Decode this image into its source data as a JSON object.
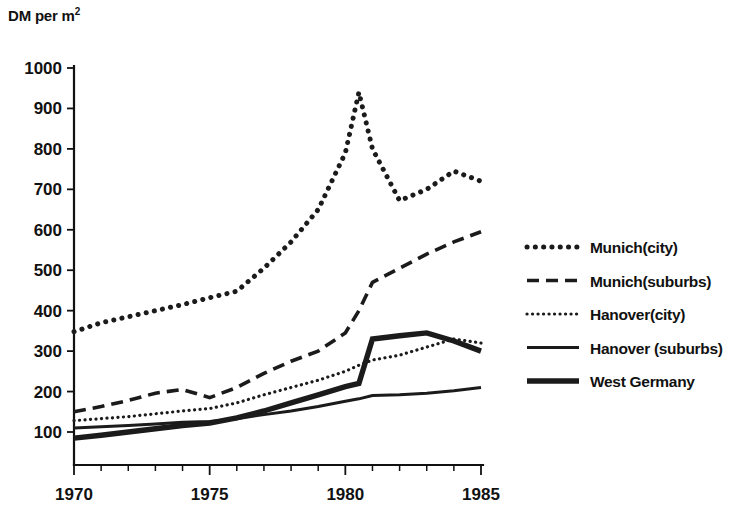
{
  "chart": {
    "y_axis_title": "DM per m",
    "y_axis_title_sup": "2",
    "y_tick_labels": [
      "1000",
      "900",
      "800",
      "700",
      "600",
      "500",
      "400",
      "300",
      "200",
      "100"
    ],
    "x_tick_labels": [
      "1970",
      "1975",
      "1980",
      "1985"
    ]
  },
  "legend": {
    "items": [
      {
        "label": "Munich(city)",
        "style": "dotted-bold",
        "key": "munich_city"
      },
      {
        "label": "Munich(suburbs)",
        "style": "dashed",
        "key": "munich_suburbs"
      },
      {
        "label": "Hanover(city)",
        "style": "dotted-fine",
        "key": "hanover_city"
      },
      {
        "label": "Hanover (suburbs)",
        "style": "solid-thin",
        "key": "hanover_suburbs"
      },
      {
        "label": "West Germany",
        "style": "solid-bold",
        "key": "west_germany"
      }
    ]
  },
  "chart_data": {
    "type": "line",
    "title": "",
    "xlabel": "",
    "ylabel": "DM per m2",
    "xlim": [
      1970,
      1985
    ],
    "ylim": [
      0,
      1000
    ],
    "yticks": [
      100,
      200,
      300,
      400,
      500,
      600,
      700,
      800,
      900,
      1000
    ],
    "xticks": [
      1970,
      1975,
      1980,
      1985
    ],
    "x_minor_tick_interval": 1,
    "grid": false,
    "legend_position": "right",
    "x": [
      1970,
      1971,
      1972,
      1973,
      1974,
      1975,
      1976,
      1977,
      1978,
      1979,
      1980,
      1980.5,
      1981,
      1982,
      1983,
      1984,
      1985
    ],
    "series": [
      {
        "name": "Munich(city)",
        "style": "dotted-bold",
        "values": [
          348,
          370,
          385,
          400,
          415,
          432,
          448,
          505,
          570,
          650,
          790,
          940,
          800,
          672,
          700,
          745,
          720
        ]
      },
      {
        "name": "Munich(suburbs)",
        "style": "dashed",
        "values": [
          150,
          163,
          178,
          196,
          205,
          185,
          210,
          245,
          275,
          300,
          345,
          400,
          470,
          505,
          540,
          570,
          595
        ]
      },
      {
        "name": "Hanover(city)",
        "style": "dotted-fine",
        "values": [
          128,
          133,
          138,
          145,
          152,
          158,
          172,
          192,
          210,
          228,
          250,
          265,
          278,
          290,
          310,
          330,
          320
        ]
      },
      {
        "name": "Hanover (suburbs)",
        "style": "solid-thin",
        "values": [
          110,
          113,
          116,
          120,
          124,
          126,
          133,
          143,
          152,
          163,
          176,
          182,
          190,
          192,
          196,
          202,
          210
        ]
      },
      {
        "name": "West Germany",
        "style": "solid-bold",
        "values": [
          85,
          92,
          100,
          108,
          116,
          122,
          135,
          152,
          172,
          192,
          212,
          220,
          330,
          338,
          345,
          325,
          300
        ]
      }
    ]
  }
}
